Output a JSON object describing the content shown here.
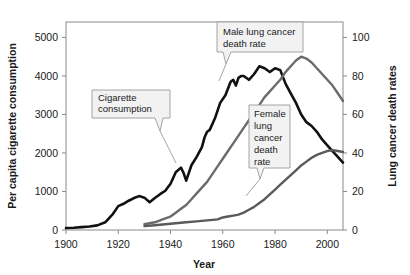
{
  "chart_data": {
    "type": "line",
    "title": "",
    "xlabel": "Year",
    "ylabel_left": "Per capita cigarette consumption",
    "ylabel_right": "Lung cancer death rates",
    "xlim": [
      1900,
      2006
    ],
    "xticks": [
      1900,
      1920,
      1940,
      1960,
      1980,
      2000
    ],
    "xticklabels": [
      "1900",
      "1920",
      "1940",
      "1960",
      "1980",
      "2000"
    ],
    "ylim_left": [
      0,
      5400
    ],
    "yticks_left": [
      0,
      1000,
      2000,
      3000,
      4000,
      5000
    ],
    "yticklabels_left": [
      "0",
      "1000",
      "2000",
      "3000",
      "4000",
      "5000"
    ],
    "ylim_right": [
      0,
      108
    ],
    "yticks_right": [
      0,
      20,
      40,
      60,
      80,
      100
    ],
    "yticklabels_right": [
      "0",
      "20",
      "40",
      "60",
      "80",
      "100"
    ],
    "grid": false,
    "legend": "callout-annotations",
    "series": [
      {
        "name": "Cigarette consumption",
        "axis": "left",
        "color": "#111111",
        "width": 2.6,
        "x": [
          1900,
          1903,
          1906,
          1909,
          1912,
          1915,
          1918,
          1920,
          1922,
          1924,
          1926,
          1928,
          1930,
          1932,
          1934,
          1936,
          1938,
          1940,
          1942,
          1944,
          1945,
          1946,
          1948,
          1950,
          1952,
          1953,
          1954,
          1955,
          1957,
          1959,
          1961,
          1963,
          1964,
          1965,
          1966,
          1967,
          1968,
          1970,
          1972,
          1974,
          1976,
          1978,
          1980,
          1982,
          1984,
          1986,
          1988,
          1990,
          1992,
          1994,
          1996,
          1998,
          2000,
          2002,
          2004,
          2006
        ],
        "y": [
          50,
          60,
          75,
          90,
          120,
          200,
          420,
          620,
          680,
          760,
          830,
          880,
          840,
          720,
          830,
          930,
          1020,
          1200,
          1500,
          1620,
          1480,
          1280,
          1680,
          1900,
          2150,
          2400,
          2550,
          2600,
          2900,
          3300,
          3500,
          3850,
          3900,
          3750,
          3950,
          4000,
          4000,
          3900,
          4050,
          4250,
          4200,
          4100,
          4200,
          4150,
          3800,
          3550,
          3300,
          3000,
          2800,
          2700,
          2550,
          2350,
          2200,
          2050,
          1900,
          1750
        ]
      },
      {
        "name": "Male lung cancer death rate",
        "axis": "right",
        "color": "#6b6b6b",
        "width": 2.4,
        "x": [
          1930,
          1932,
          1934,
          1936,
          1938,
          1940,
          1942,
          1944,
          1946,
          1948,
          1950,
          1952,
          1954,
          1956,
          1958,
          1960,
          1962,
          1964,
          1966,
          1968,
          1970,
          1972,
          1974,
          1976,
          1978,
          1980,
          1982,
          1984,
          1986,
          1988,
          1990,
          1992,
          1994,
          1996,
          1998,
          2000,
          2002,
          2004,
          2006
        ],
        "y": [
          3,
          3.5,
          4,
          5,
          6,
          7,
          9,
          11,
          13,
          16,
          19,
          22,
          25,
          29,
          33,
          37,
          41,
          45,
          49,
          53,
          57,
          61,
          65,
          69,
          72,
          75,
          78,
          82,
          85,
          88,
          90,
          89,
          87,
          84,
          81,
          78,
          75,
          71,
          67
        ]
      },
      {
        "name": "Female lung cancer death rate",
        "axis": "right",
        "color": "#5a5a5a",
        "width": 2.4,
        "x": [
          1930,
          1934,
          1938,
          1942,
          1946,
          1950,
          1954,
          1958,
          1960,
          1962,
          1964,
          1966,
          1968,
          1970,
          1972,
          1974,
          1976,
          1978,
          1980,
          1982,
          1984,
          1986,
          1988,
          1990,
          1992,
          1994,
          1996,
          1998,
          2000,
          2002,
          2004,
          2006
        ],
        "y": [
          2,
          2.5,
          3,
          3.5,
          4,
          4.5,
          5,
          5.5,
          6.5,
          7,
          7.5,
          8,
          9,
          10.5,
          12,
          14,
          16,
          18.5,
          21,
          23.5,
          26,
          28.5,
          31,
          33.5,
          35.5,
          37.5,
          39,
          40,
          41,
          41.5,
          41,
          40.5
        ]
      }
    ],
    "annotations": [
      {
        "id": "cigarette",
        "label": "Cigarette consumption",
        "lines": [
          "Cigarette",
          "consumption"
        ]
      },
      {
        "id": "male",
        "label": "Male lung cancer death rate",
        "lines": [
          "Male lung cancer",
          "death rate"
        ]
      },
      {
        "id": "female",
        "label": "Female lung cancer death rate",
        "lines": [
          "Female",
          "lung",
          "cancer",
          "death",
          "rate"
        ]
      }
    ]
  }
}
